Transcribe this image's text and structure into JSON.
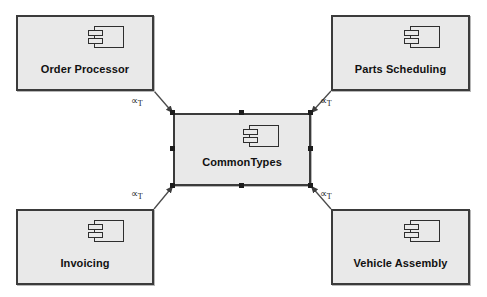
{
  "diagram": {
    "background_color": "#ffffff",
    "component_fill": "#e9e9e9",
    "component_border": "#3b3b3b",
    "connector_color": "#4a4a4a",
    "handle_color": "#1c1c1c"
  },
  "components": [
    {
      "id": "order-processor",
      "label": "Order Processor",
      "x": 16,
      "y": 15,
      "width": 138,
      "height": 76,
      "selected": false,
      "icon": "uml-component-icon"
    },
    {
      "id": "parts-scheduling",
      "label": "Parts Scheduling",
      "x": 331,
      "y": 15,
      "width": 139,
      "height": 76,
      "selected": false,
      "icon": "uml-component-icon"
    },
    {
      "id": "common-types",
      "label": "CommonTypes",
      "x": 173,
      "y": 113,
      "width": 138,
      "height": 73,
      "selected": true,
      "icon": "uml-component-icon"
    },
    {
      "id": "invoicing",
      "label": "Invoicing",
      "x": 16,
      "y": 209,
      "width": 138,
      "height": 76,
      "selected": false,
      "icon": "uml-component-icon"
    },
    {
      "id": "vehicle-assembly",
      "label": "Vehicle Assembly",
      "x": 331,
      "y": 209,
      "width": 139,
      "height": 76,
      "selected": true,
      "icon": "uml-component-icon"
    }
  ],
  "connectors": [
    {
      "id": "order-processor-to-common-types",
      "from": "order-processor",
      "to": "common-types",
      "x1": 154,
      "y1": 91,
      "x2": 173,
      "y2": 113,
      "arrow_at": "common-types",
      "stereotype_main": "∝",
      "stereotype_sub": "T",
      "label_x": 131,
      "label_y": 95
    },
    {
      "id": "parts-scheduling-to-common-types",
      "from": "parts-scheduling",
      "to": "common-types",
      "x1": 331,
      "y1": 91,
      "x2": 311,
      "y2": 113,
      "arrow_at": "common-types",
      "stereotype_main": "∝",
      "stereotype_sub": "T",
      "label_x": 320,
      "label_y": 95
    },
    {
      "id": "invoicing-to-common-types",
      "from": "invoicing",
      "to": "common-types",
      "x1": 154,
      "y1": 209,
      "x2": 173,
      "y2": 186,
      "arrow_at": "common-types",
      "stereotype_main": "∝",
      "stereotype_sub": "T",
      "label_x": 131,
      "label_y": 188
    },
    {
      "id": "vehicle-assembly-to-common-types",
      "from": "vehicle-assembly",
      "to": "common-types",
      "x1": 331,
      "y1": 209,
      "x2": 311,
      "y2": 186,
      "arrow_at": "common-types",
      "stereotype_main": "∝",
      "stereotype_sub": "T",
      "label_x": 320,
      "label_y": 188
    }
  ],
  "selection_handles": [
    {
      "x": 170,
      "y": 110
    },
    {
      "x": 239,
      "y": 110
    },
    {
      "x": 308,
      "y": 110
    },
    {
      "x": 170,
      "y": 146
    },
    {
      "x": 308,
      "y": 146
    },
    {
      "x": 170,
      "y": 183
    },
    {
      "x": 239,
      "y": 183
    },
    {
      "x": 308,
      "y": 183
    }
  ]
}
